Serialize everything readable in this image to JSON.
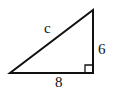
{
  "diagram": {
    "type": "right-triangle",
    "labels": {
      "hypotenuse": "c",
      "vertical_leg": "6",
      "horizontal_leg": "8"
    },
    "vertices": {
      "bottom_left": [
        10,
        73
      ],
      "bottom_right": [
        93,
        73
      ],
      "top_right": [
        93,
        10
      ]
    },
    "right_angle_marker": "bottom-right",
    "stroke_color": "#111111",
    "background": "#ffffff"
  }
}
